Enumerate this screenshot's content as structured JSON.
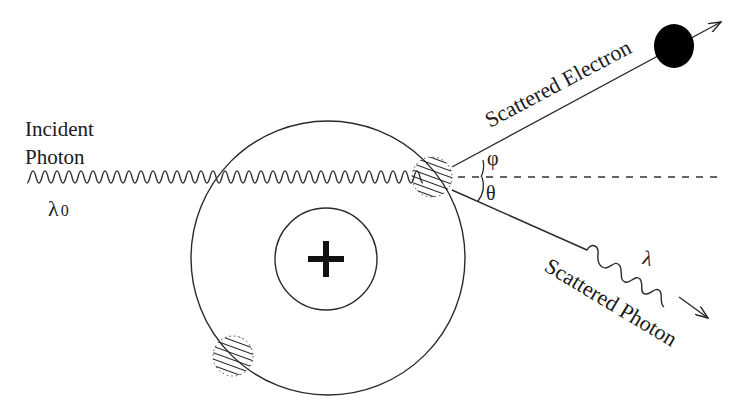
{
  "diagram": {
    "labels": {
      "incident_line1": "Incident",
      "incident_line2": "Photon",
      "incident_wavelength": "λ",
      "incident_wavelength_sub": "0",
      "scattered_electron": "Scattered Electron",
      "scattered_photon": "Scattered Photon",
      "scattered_wavelength": "λ",
      "electron_angle": "φ",
      "photon_angle": "θ",
      "nucleus_symbol": "+"
    },
    "colors": {
      "stroke": "#2a2a2a",
      "electron_fill": "#000000",
      "background": "#ffffff"
    }
  }
}
